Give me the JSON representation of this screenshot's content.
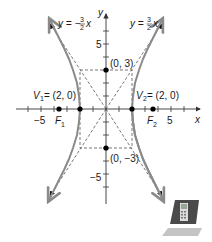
{
  "diagram": {
    "type": "hyperbola-graph",
    "equation_shown": false,
    "axes": {
      "x_label": "x",
      "y_label": "y",
      "x_tick_labels": [
        {
          "value": -5,
          "text": "−5"
        },
        {
          "value": 5,
          "text": "5"
        }
      ],
      "y_tick_labels": [
        {
          "value": 5,
          "text": "5"
        },
        {
          "value": -5,
          "text": "−5"
        }
      ],
      "x_range": [
        -7,
        7
      ],
      "y_range": [
        -7,
        7
      ]
    },
    "asymptotes": [
      {
        "name": "negative",
        "label_lhs": "y = −",
        "num": "3",
        "den": "2",
        "var": "x"
      },
      {
        "name": "positive",
        "label_lhs": "y = ",
        "num": "3",
        "den": "2",
        "var": "x"
      }
    ],
    "points": {
      "v1": {
        "name": "V",
        "sub": "1",
        "coords": "= (2, 0)"
      },
      "v2": {
        "name": "V",
        "sub": "2",
        "coords": "= (2, 0)"
      },
      "f1": {
        "name": "F",
        "sub": "1"
      },
      "f2": {
        "name": "F",
        "sub": "2"
      },
      "top": {
        "coords": "(0, 3)"
      },
      "bottom": {
        "coords": "(0, −3)"
      }
    },
    "colors": {
      "curve": "#8a8a8a",
      "axes": "#333333",
      "dashed": "#555555",
      "points": "#000000"
    }
  },
  "icon": {
    "name": "graphing-calculator-icon"
  }
}
